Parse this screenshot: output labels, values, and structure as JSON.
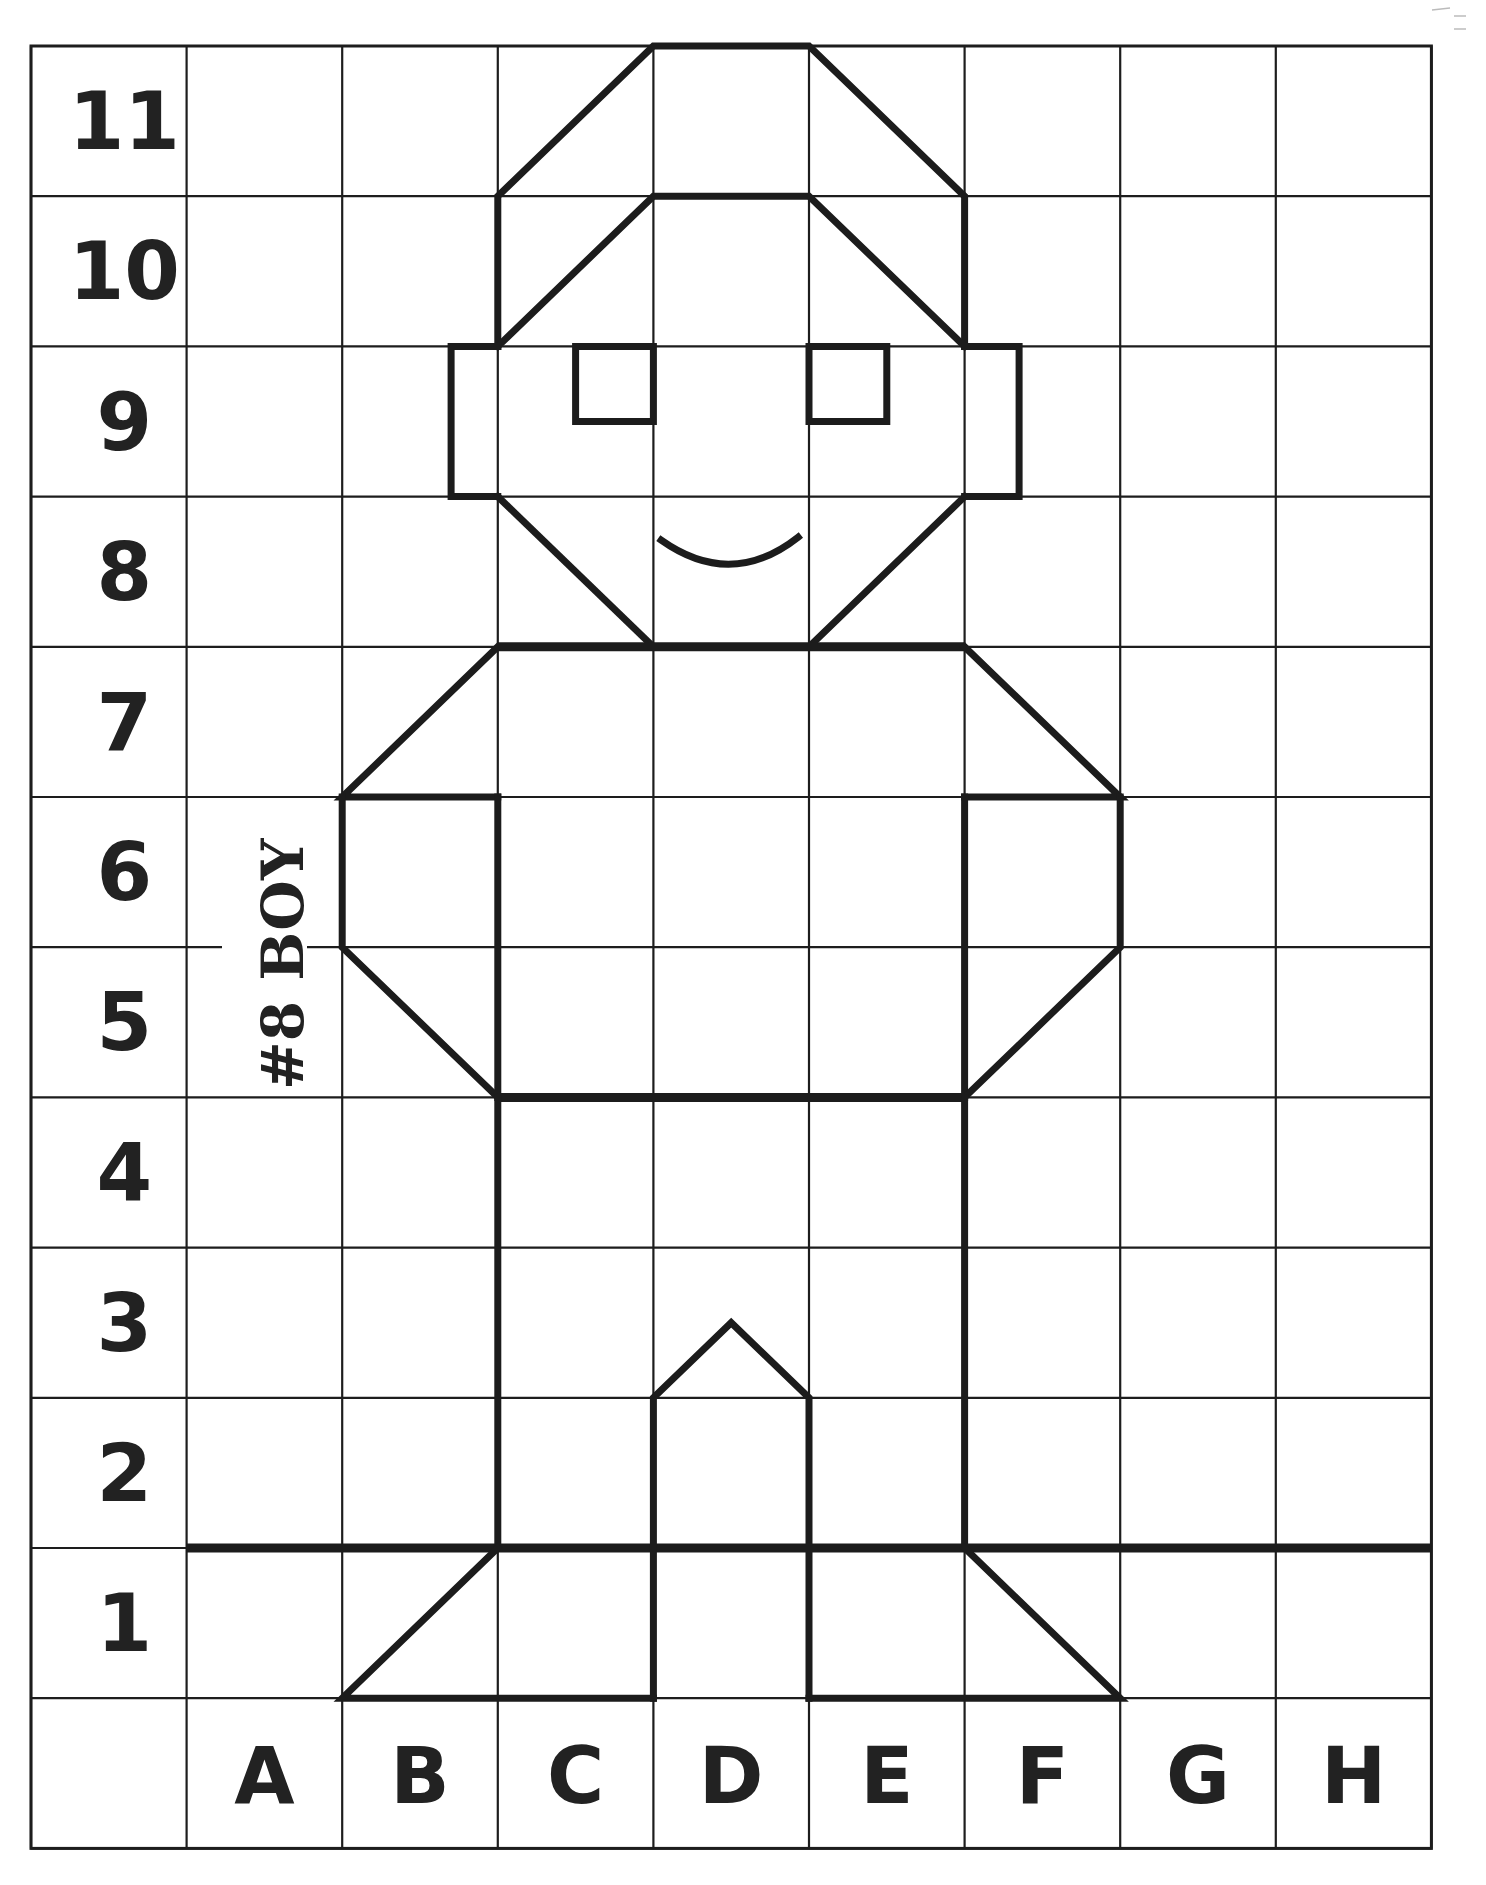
{
  "worksheet": {
    "title": "#8 BOY",
    "type": "coordinate grid drawing worksheet",
    "row_labels": [
      "11",
      "10",
      "9",
      "8",
      "7",
      "6",
      "5",
      "4",
      "3",
      "2",
      "1"
    ],
    "column_labels": [
      "A",
      "B",
      "C",
      "D",
      "E",
      "F",
      "G",
      "H"
    ],
    "grid": {
      "columns_including_label_column": 9,
      "rows_including_label_row": 12
    },
    "figure": {
      "subject": "boy",
      "parts": [
        "hat",
        "hair",
        "ears",
        "eyes",
        "smile",
        "shoulders",
        "arms",
        "torso",
        "legs",
        "feet"
      ]
    },
    "colors": {
      "background": "#ffffff",
      "ink": "#1c1c1c"
    }
  }
}
